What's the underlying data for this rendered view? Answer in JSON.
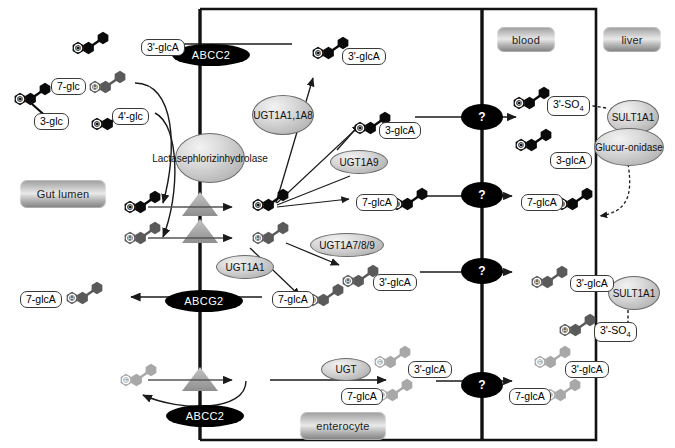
{
  "figure": {
    "type": "pathway-diagram"
  },
  "compartments": [
    {
      "id": "gut-lumen",
      "label": "Gut lumen",
      "x": 20,
      "y": 180,
      "w": 86,
      "h": 28
    },
    {
      "id": "blood",
      "label": "blood",
      "x": 497,
      "y": 27,
      "w": 58,
      "h": 25
    },
    {
      "id": "liver",
      "label": "liver",
      "x": 603,
      "y": 27,
      "w": 58,
      "h": 25
    },
    {
      "id": "enterocyte",
      "label": "enterocyte",
      "x": 300,
      "y": 412,
      "w": 86,
      "h": 28
    }
  ],
  "enzymes": [
    {
      "id": "lactase-phlorizin-hydrolase",
      "label": "Lactase phlorizin hydrolase",
      "lines": [
        "Lactase",
        "phlorizin",
        "hydrolase"
      ],
      "x": 175,
      "y": 133,
      "w": 68,
      "h": 48
    },
    {
      "id": "ugt1a1-1a8",
      "label": "UGT1A1, 1A8",
      "lines": [
        "UGT1A1,",
        "1A8"
      ],
      "x": 252,
      "y": 95,
      "w": 60,
      "h": 38
    },
    {
      "id": "ugt1a9",
      "label": "UGT1A9",
      "lines": [
        "UGT1A9"
      ],
      "x": 330,
      "y": 150,
      "w": 56,
      "h": 22
    },
    {
      "id": "ugt1a1",
      "label": "UGT1A1",
      "lines": [
        "UGT1A1"
      ],
      "x": 216,
      "y": 255,
      "w": 56,
      "h": 22
    },
    {
      "id": "ugt1a7-8-9",
      "label": "UGT1A7/8/9",
      "lines": [
        "UGT1A7/8/9"
      ],
      "x": 310,
      "y": 233,
      "w": 72,
      "h": 22
    },
    {
      "id": "ugt",
      "label": "UGT",
      "lines": [
        "UGT"
      ],
      "x": 321,
      "y": 358,
      "w": 48,
      "h": 21
    },
    {
      "id": "sult1a1-top",
      "label": "SULT 1A1",
      "lines": [
        "SULT",
        "1A1"
      ],
      "x": 607,
      "y": 100,
      "w": 50,
      "h": 32
    },
    {
      "id": "glucuronidase",
      "label": "Glucuronidase",
      "lines": [
        "Glucur-",
        "onidase"
      ],
      "x": 594,
      "y": 128,
      "w": 68,
      "h": 36
    },
    {
      "id": "sult1a1-bottom",
      "label": "SULT 1A1",
      "lines": [
        "SULT",
        "1A1"
      ],
      "x": 608,
      "y": 276,
      "w": 50,
      "h": 32
    }
  ],
  "transporters": [
    {
      "id": "abcc2-top",
      "label": "ABCC2",
      "x": 172,
      "y": 44,
      "w": 78,
      "h": 22
    },
    {
      "id": "abcg2",
      "label": "ABCG2",
      "x": 165,
      "y": 290,
      "w": 78,
      "h": 22
    },
    {
      "id": "abcc2-bottom",
      "label": "ABCC2",
      "x": 166,
      "y": 405,
      "w": 78,
      "h": 22
    }
  ],
  "unknown_transport_markers": [
    {
      "id": "unknown-transport-1",
      "label": "?",
      "x": 461,
      "y": 104,
      "w": 42,
      "h": 26
    },
    {
      "id": "unknown-transport-2",
      "label": "?",
      "x": 461,
      "y": 182,
      "w": 42,
      "h": 26
    },
    {
      "id": "unknown-transport-3",
      "label": "?",
      "x": 461,
      "y": 258,
      "w": 42,
      "h": 26
    },
    {
      "id": "unknown-transport-4",
      "label": "?",
      "x": 461,
      "y": 372,
      "w": 42,
      "h": 26
    }
  ],
  "chem_labels": [
    {
      "id": "lumen-3prime-glcA",
      "text": "3'-glcA",
      "x": 141,
      "y": 39
    },
    {
      "id": "lumen-7-glc",
      "text": "7-glc",
      "x": 51,
      "y": 78
    },
    {
      "id": "lumen-3-glc",
      "text": "3-glc",
      "x": 34,
      "y": 113
    },
    {
      "id": "lumen-4prime-glc",
      "text": "4'-glc",
      "x": 112,
      "y": 108
    },
    {
      "id": "ent-3prime-glcA-top",
      "text": "3'-glcA",
      "x": 342,
      "y": 48
    },
    {
      "id": "ent-3-glcA",
      "text": "3-glcA",
      "x": 379,
      "y": 122
    },
    {
      "id": "ent-7-glcA-row",
      "text": "7-glcA",
      "x": 356,
      "y": 194
    },
    {
      "id": "ent-3prime-glcA-mid",
      "text": "3'-glcA",
      "x": 373,
      "y": 274
    },
    {
      "id": "ent-7-glcA-abcg2",
      "text": "7-glcA",
      "x": 272,
      "y": 291
    },
    {
      "id": "lumen-7-glcA-abcg2",
      "text": "7-glcA",
      "x": 20,
      "y": 291
    },
    {
      "id": "ent-3prime-glcA-bottom",
      "text": "3'-glcA",
      "x": 408,
      "y": 361
    },
    {
      "id": "ent-7-glcA-bottom",
      "text": "7-glcA",
      "x": 341,
      "y": 388
    },
    {
      "id": "blood-3prime-SO4-top",
      "text": "3'-SO4",
      "x": 547,
      "y": 96,
      "sub": "4"
    },
    {
      "id": "blood-3-glcA",
      "text": "3-glcA",
      "x": 550,
      "y": 152
    },
    {
      "id": "blood-7-glcA",
      "text": "7-glcA",
      "x": 521,
      "y": 194
    },
    {
      "id": "blood-3prime-glcA-mid",
      "text": "3'-glcA",
      "x": 570,
      "y": 275
    },
    {
      "id": "blood-3prime-SO4-bottom",
      "text": "3'-SO4",
      "x": 594,
      "y": 322,
      "sub": "4"
    },
    {
      "id": "blood-3prime-glcA-bottom",
      "text": "3'-glcA",
      "x": 565,
      "y": 361
    },
    {
      "id": "blood-7-glcA-bottom",
      "text": "7-glcA",
      "x": 509,
      "y": 388
    }
  ],
  "molecules": {
    "quercetin_glyph": "O",
    "hesperetin_glyph": "H",
    "epicatechin_glyph": "E",
    "colors": {
      "quercetin": "#0a0a0a",
      "hesperetin": "#5a5a5a",
      "epicatechin": "#a8a8a8",
      "membrane": "#111111",
      "transporter_triangle": "#9a9a9a",
      "arrow": "#222222"
    }
  },
  "colors": {
    "background": "#ffffff",
    "outline": "#111111",
    "enzyme_fill": "#cfcfcf",
    "transporter_fill": "#000000",
    "label_border": "#3a3a3a"
  }
}
